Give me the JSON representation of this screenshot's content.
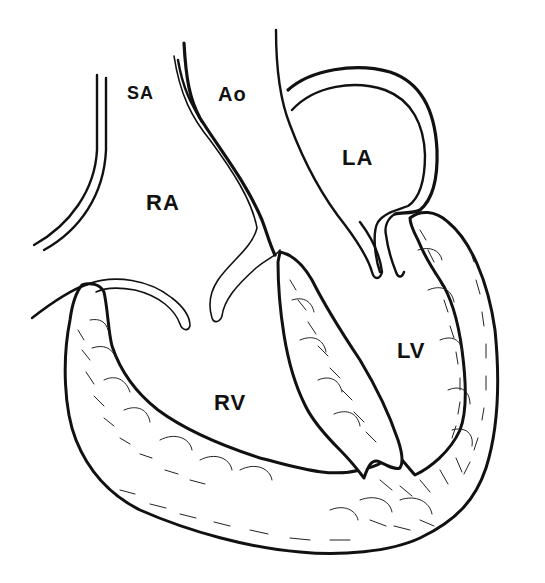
{
  "figure": {
    "type": "anatomical-line-drawing",
    "background_color": "#ffffff",
    "ink_color": "#111111"
  },
  "labels": {
    "sa": {
      "text": "SA",
      "x": 127,
      "y": 84,
      "size": 18
    },
    "ao": {
      "text": "Ao",
      "x": 218,
      "y": 84,
      "size": 20
    },
    "la": {
      "text": "LA",
      "x": 342,
      "y": 147,
      "size": 22
    },
    "ra": {
      "text": "RA",
      "x": 146,
      "y": 192,
      "size": 22
    },
    "lv": {
      "text": "LV",
      "x": 397,
      "y": 340,
      "size": 22
    },
    "rv": {
      "text": "RV",
      "x": 214,
      "y": 392,
      "size": 22
    }
  }
}
